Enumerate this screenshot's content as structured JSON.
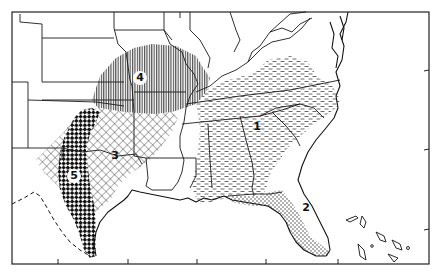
{
  "map": {
    "title": "",
    "region": "Southeastern and South-Central United States",
    "zones": [
      {
        "id": "1",
        "label": "1",
        "pattern": "horizontal-dashes",
        "area": "Southeast (Kentucky/Tennessee to the Carolinas, Georgia, Alabama, Mississippi)"
      },
      {
        "id": "2",
        "label": "2",
        "pattern": "dots",
        "area": "Florida peninsula and Gulf coast panhandle"
      },
      {
        "id": "3",
        "label": "3",
        "pattern": "crosshatch",
        "area": "Oklahoma / central-east Texas"
      },
      {
        "id": "4",
        "label": "4",
        "pattern": "vertical-lines",
        "area": "Kansas / Missouri"
      },
      {
        "id": "5",
        "label": "5",
        "pattern": "dense-checkered",
        "area": "Central Texas strip to the Gulf coast"
      }
    ],
    "frame_ticks": {
      "bottom_x": [
        58,
        128,
        197,
        266,
        338
      ],
      "right_y": [
        70,
        149,
        229
      ]
    },
    "colors": {
      "line": "#1a1a1a",
      "background": "#ffffff"
    }
  }
}
